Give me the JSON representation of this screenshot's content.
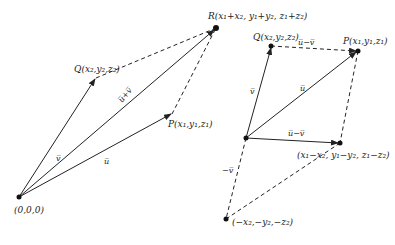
{
  "left_diagram": {
    "points": {
      "origin": {
        "label": "(0,0,0)",
        "x": 19,
        "y": 197
      },
      "P": {
        "label": "P(x₁,y₁,z₁)",
        "x": 172,
        "y": 114
      },
      "Q": {
        "label": "Q(x₂,y₂,z₂)",
        "x": 96,
        "y": 78
      },
      "R": {
        "label": "R(x₁+x₂, y₁+y₂, z₁+z₂)",
        "x": 216,
        "y": 28
      }
    },
    "vectors": {
      "u": "u̅",
      "v": "v̅",
      "u_plus_v": "u̅+v̅"
    }
  },
  "right_diagram": {
    "points": {
      "origin": {
        "x": 246,
        "y": 138
      },
      "Q": {
        "label": "Q(x₂,y₂,z₂)",
        "x": 271,
        "y": 46
      },
      "P": {
        "label": "P(x₁,y₁,z₁)",
        "x": 358,
        "y": 51
      },
      "D": {
        "label": "(x₁−x₂, y₁−y₂, z₁−z₂)",
        "x": 340,
        "y": 143
      },
      "negV": {
        "label": "(−x₂,−y₂,−z₂)",
        "x": 226,
        "y": 219
      }
    },
    "vectors": {
      "u": "u̅",
      "v": "v̅",
      "u_minus_v_top": "u̅−v̅",
      "u_minus_v": "u̅−v̅",
      "neg_v": "−v̅"
    }
  }
}
